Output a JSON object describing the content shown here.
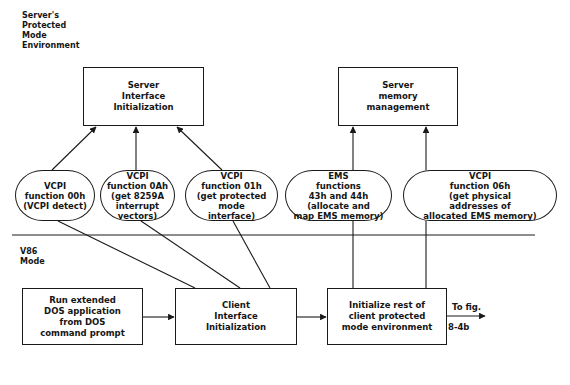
{
  "regions": {
    "protected_mode_label": "Server's\nProtected\nMode\nEnvironment",
    "v86_mode_label": "V86\nMode"
  },
  "server_boxes": {
    "interface_init": "Server\nInterface\nInitialization",
    "memory_management": "Server\nmemory\nmanagement"
  },
  "function_nodes": [
    {
      "id": "vcpi-00h",
      "text": "VCPI\nfunction 00h\n(VCPI detect)"
    },
    {
      "id": "vcpi-0ah",
      "text": "VCPI\nfunction 0Ah\n(get 8259A\ninterrupt\nvectors)"
    },
    {
      "id": "vcpi-01h",
      "text": "VCPI\nfunction 01h\n(get protected\nmode\ninterface)"
    },
    {
      "id": "ems-43h-44h",
      "text": "EMS\nfunctions\n43h and 44h\n(allocate and\nmap EMS memory)"
    },
    {
      "id": "vcpi-06h",
      "text": "VCPI\nfunction 06h\n(get physical\naddresses of\nallocated EMS memory)"
    }
  ],
  "client_boxes": {
    "run_app": "Run extended\nDOS application\nfrom DOS\ncommand prompt",
    "client_init": "Client\nInterface\nInitialization",
    "init_rest": "Initialize rest of\nclient protected\nmode environment"
  },
  "continuation": {
    "line1": "To fig.",
    "line2": "8-4b"
  },
  "colors": {
    "line": "#1a1a1a",
    "background": "#ffffff"
  }
}
